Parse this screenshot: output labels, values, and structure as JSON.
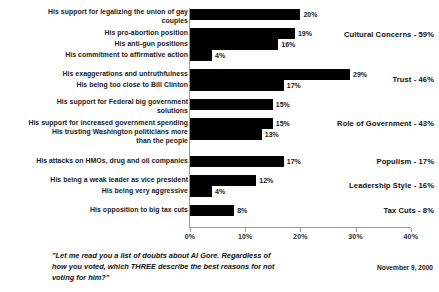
{
  "chart_data": {
    "type": "bar",
    "orientation": "horizontal",
    "title": "",
    "xlabel": "",
    "ylabel": "",
    "xlim": [
      0,
      40
    ],
    "xtick_labels": [
      "0%",
      "10%",
      "20%",
      "30%",
      "40%"
    ],
    "xticks": [
      0,
      10,
      20,
      30,
      40
    ],
    "grid": false,
    "legend": "none",
    "bar_color": "#000000",
    "value_suffix": "%",
    "groups": [
      {
        "name": "Cultural Concerns",
        "total": 59,
        "summary_label": "Cultural Concerns - 59%",
        "items": [
          {
            "label": "His support for legalizing the union of gay couples",
            "value": 20,
            "value_label": "20%"
          },
          {
            "label": "His pro-abortion position",
            "value": 19,
            "value_label": "19%"
          },
          {
            "label": "His anti-gun positions",
            "value": 16,
            "value_label": "16%"
          },
          {
            "label": "His commitment to affirmative action",
            "value": 4,
            "value_label": "4%"
          }
        ]
      },
      {
        "name": "Trust",
        "total": 46,
        "summary_label": "Trust - 46%",
        "items": [
          {
            "label": "His exaggerations and untruthfulness",
            "value": 29,
            "value_label": "29%"
          },
          {
            "label": "His being too close to Bill Clinton",
            "value": 17,
            "value_label": "17%"
          }
        ]
      },
      {
        "name": "Role of Government",
        "total": 43,
        "summary_label": "Role of Government - 43%",
        "items": [
          {
            "label": "His support for Federal big government solutions",
            "value": 15,
            "value_label": "15%"
          },
          {
            "label": "His support for increased government spending",
            "value": 15,
            "value_label": "15%"
          },
          {
            "label": "His trusting Washington politicians more than the people",
            "value": 13,
            "value_label": "13%"
          }
        ]
      },
      {
        "name": "Populism",
        "total": 17,
        "summary_label": "Populism - 17%",
        "items": [
          {
            "label": "His attacks on HMOs, drug and oil companies",
            "value": 17,
            "value_label": "17%"
          }
        ]
      },
      {
        "name": "Leadership Style",
        "total": 16,
        "summary_label": "Leadership Style - 16%",
        "items": [
          {
            "label": "His being a weak leader as vice president",
            "value": 12,
            "value_label": "12%"
          },
          {
            "label": "His being very aggressive",
            "value": 4,
            "value_label": "4%"
          }
        ]
      },
      {
        "name": "Tax Cuts",
        "total": 8,
        "summary_label": "Tax Cuts - 8%",
        "items": [
          {
            "label": "His opposition to big tax cuts",
            "value": 8,
            "value_label": "8%"
          }
        ]
      }
    ]
  },
  "footer": {
    "question": "\"Let me read you a list of doubts about Al Gore. Regardless of how you voted, which THREE describe the best reasons for not voting for him?\"",
    "date": "November 9, 2000"
  }
}
